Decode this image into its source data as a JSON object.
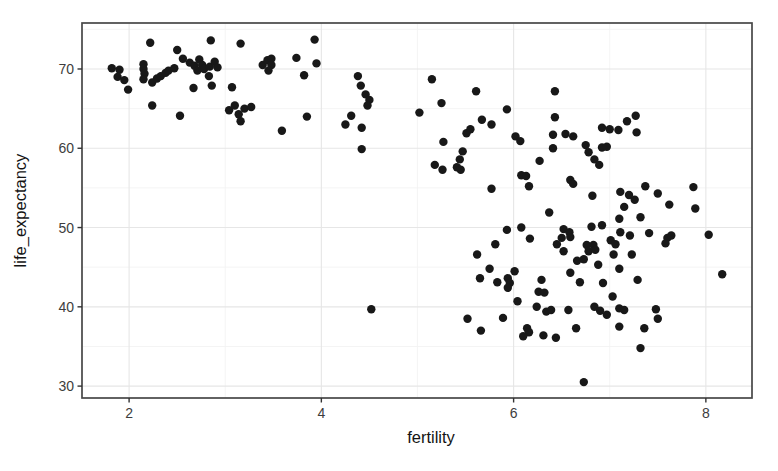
{
  "figure": {
    "background": "#ffffff"
  },
  "chart_data": {
    "type": "scatter",
    "title": "",
    "xlabel": "fertility",
    "ylabel": "life_expectancy",
    "x_ticks": [
      2,
      4,
      6,
      8
    ],
    "y_ticks": [
      30,
      40,
      50,
      60,
      70
    ],
    "x_minor_ticks": [
      3,
      5,
      7
    ],
    "y_minor_ticks": [
      35,
      45,
      55,
      65,
      75
    ],
    "xlim": [
      1.51,
      8.48
    ],
    "ylim": [
      28.5,
      75.8
    ],
    "grid": true,
    "legend": "none",
    "marker": {
      "shape": "circle",
      "color": "#181818",
      "radius_px": 4.2
    },
    "style": {
      "panel_background": "#ffffff",
      "panel_border": "#474747",
      "grid_major": "#e6e6e6",
      "grid_minor": "#f3f3f3",
      "tick_color": "#333333",
      "tick_label_color": "#3d3d3d",
      "axis_title_color": "#141414"
    },
    "points": [
      [
        2.22,
        73.3
      ],
      [
        2.85,
        73.6
      ],
      [
        3.16,
        73.2
      ],
      [
        3.93,
        73.7
      ],
      [
        1.82,
        70.1
      ],
      [
        1.9,
        69.9
      ],
      [
        1.88,
        69.0
      ],
      [
        1.95,
        68.6
      ],
      [
        1.99,
        67.4
      ],
      [
        2.15,
        70.6
      ],
      [
        2.15,
        70.0
      ],
      [
        2.16,
        69.4
      ],
      [
        2.15,
        68.7
      ],
      [
        2.24,
        68.3
      ],
      [
        2.29,
        68.8
      ],
      [
        2.33,
        69.1
      ],
      [
        2.38,
        69.5
      ],
      [
        2.41,
        69.8
      ],
      [
        2.47,
        70.1
      ],
      [
        2.5,
        72.4
      ],
      [
        2.56,
        71.3
      ],
      [
        2.63,
        70.8
      ],
      [
        2.68,
        70.4
      ],
      [
        2.73,
        71.2
      ],
      [
        2.76,
        70.5
      ],
      [
        2.71,
        69.8
      ],
      [
        2.78,
        70.0
      ],
      [
        2.84,
        70.3
      ],
      [
        2.89,
        70.9
      ],
      [
        2.92,
        70.2
      ],
      [
        2.83,
        69.1
      ],
      [
        2.67,
        67.6
      ],
      [
        2.86,
        67.9
      ],
      [
        3.07,
        67.7
      ],
      [
        2.24,
        65.4
      ],
      [
        2.53,
        64.1
      ],
      [
        3.04,
        64.8
      ],
      [
        3.1,
        65.4
      ],
      [
        3.14,
        64.3
      ],
      [
        3.16,
        63.4
      ],
      [
        3.2,
        65.0
      ],
      [
        3.27,
        65.2
      ],
      [
        3.39,
        70.5
      ],
      [
        3.44,
        71.1
      ],
      [
        3.48,
        71.3
      ],
      [
        3.48,
        70.5
      ],
      [
        3.45,
        69.8
      ],
      [
        3.74,
        71.4
      ],
      [
        3.95,
        70.7
      ],
      [
        3.82,
        69.2
      ],
      [
        3.85,
        64.0
      ],
      [
        3.59,
        62.2
      ],
      [
        4.38,
        69.1
      ],
      [
        4.41,
        67.9
      ],
      [
        4.46,
        66.8
      ],
      [
        4.5,
        66.1
      ],
      [
        4.48,
        65.4
      ],
      [
        4.31,
        64.1
      ],
      [
        4.25,
        63.0
      ],
      [
        4.42,
        62.6
      ],
      [
        4.42,
        59.9
      ],
      [
        5.15,
        68.7
      ],
      [
        5.25,
        65.7
      ],
      [
        5.61,
        67.2
      ],
      [
        5.02,
        64.5
      ],
      [
        5.67,
        63.6
      ],
      [
        5.77,
        63.0
      ],
      [
        5.51,
        61.9
      ],
      [
        5.55,
        62.4
      ],
      [
        5.27,
        60.8
      ],
      [
        5.47,
        59.6
      ],
      [
        5.44,
        58.6
      ],
      [
        5.18,
        57.9
      ],
      [
        5.26,
        57.3
      ],
      [
        5.41,
        57.6
      ],
      [
        5.45,
        57.3
      ],
      [
        5.77,
        54.9
      ],
      [
        5.93,
        64.9
      ],
      [
        6.02,
        61.5
      ],
      [
        6.07,
        60.9
      ],
      [
        6.27,
        58.4
      ],
      [
        6.08,
        56.6
      ],
      [
        6.13,
        56.5
      ],
      [
        6.16,
        55.2
      ],
      [
        6.43,
        67.2
      ],
      [
        6.43,
        63.9
      ],
      [
        6.41,
        61.7
      ],
      [
        6.54,
        61.8
      ],
      [
        6.62,
        61.5
      ],
      [
        6.41,
        60.0
      ],
      [
        6.75,
        60.4
      ],
      [
        6.78,
        59.5
      ],
      [
        6.59,
        56.0
      ],
      [
        6.62,
        55.5
      ],
      [
        6.92,
        60.1
      ],
      [
        6.97,
        60.2
      ],
      [
        6.84,
        58.6
      ],
      [
        6.89,
        57.9
      ],
      [
        6.92,
        62.6
      ],
      [
        7.0,
        62.4
      ],
      [
        7.09,
        62.3
      ],
      [
        7.18,
        63.4
      ],
      [
        7.27,
        64.1
      ],
      [
        7.28,
        62.0
      ],
      [
        7.11,
        54.5
      ],
      [
        7.2,
        54.1
      ],
      [
        7.26,
        53.5
      ],
      [
        7.37,
        55.2
      ],
      [
        7.5,
        54.3
      ],
      [
        7.15,
        52.6
      ],
      [
        6.82,
        54.0
      ],
      [
        7.62,
        52.9
      ],
      [
        7.87,
        55.1
      ],
      [
        7.89,
        52.4
      ],
      [
        6.37,
        51.9
      ],
      [
        5.93,
        49.7
      ],
      [
        6.08,
        50.0
      ],
      [
        6.17,
        48.6
      ],
      [
        5.81,
        47.9
      ],
      [
        5.62,
        46.6
      ],
      [
        6.52,
        49.8
      ],
      [
        6.58,
        49.4
      ],
      [
        6.5,
        48.7
      ],
      [
        6.59,
        48.8
      ],
      [
        6.45,
        47.9
      ],
      [
        6.52,
        47.0
      ],
      [
        5.75,
        44.8
      ],
      [
        5.65,
        43.6
      ],
      [
        5.83,
        43.1
      ],
      [
        5.94,
        43.6
      ],
      [
        5.96,
        43.0
      ],
      [
        5.94,
        42.4
      ],
      [
        6.01,
        44.5
      ],
      [
        6.29,
        43.4
      ],
      [
        6.26,
        41.9
      ],
      [
        6.32,
        41.8
      ],
      [
        6.04,
        40.7
      ],
      [
        6.24,
        40.0
      ],
      [
        6.34,
        39.4
      ],
      [
        6.39,
        39.6
      ],
      [
        6.57,
        39.6
      ],
      [
        5.52,
        38.5
      ],
      [
        5.89,
        38.6
      ],
      [
        5.66,
        37.0
      ],
      [
        6.14,
        37.3
      ],
      [
        6.16,
        36.8
      ],
      [
        6.1,
        36.3
      ],
      [
        6.31,
        36.4
      ],
      [
        6.44,
        36.1
      ],
      [
        6.65,
        37.3
      ],
      [
        6.73,
        30.5
      ],
      [
        4.52,
        39.7
      ],
      [
        7.32,
        51.3
      ],
      [
        7.1,
        51.1
      ],
      [
        6.81,
        50.1
      ],
      [
        6.92,
        50.3
      ],
      [
        7.11,
        49.4
      ],
      [
        7.21,
        49.0
      ],
      [
        7.41,
        49.3
      ],
      [
        7.6,
        48.7
      ],
      [
        7.64,
        49.0
      ],
      [
        7.58,
        48.0
      ],
      [
        8.03,
        49.1
      ],
      [
        6.76,
        47.8
      ],
      [
        6.83,
        47.8
      ],
      [
        6.78,
        47.0
      ],
      [
        6.85,
        47.2
      ],
      [
        7.01,
        48.4
      ],
      [
        7.06,
        47.9
      ],
      [
        7.04,
        46.6
      ],
      [
        7.23,
        46.6
      ],
      [
        6.66,
        45.8
      ],
      [
        6.73,
        46.0
      ],
      [
        6.88,
        45.3
      ],
      [
        6.59,
        44.3
      ],
      [
        7.1,
        44.8
      ],
      [
        6.69,
        43.1
      ],
      [
        6.93,
        43.0
      ],
      [
        7.29,
        43.4
      ],
      [
        7.03,
        41.3
      ],
      [
        6.84,
        40.0
      ],
      [
        6.9,
        39.5
      ],
      [
        6.97,
        39.0
      ],
      [
        7.1,
        39.8
      ],
      [
        7.15,
        39.6
      ],
      [
        7.48,
        39.7
      ],
      [
        7.5,
        38.5
      ],
      [
        7.1,
        37.5
      ],
      [
        7.36,
        37.3
      ],
      [
        7.32,
        34.8
      ],
      [
        8.17,
        44.1
      ]
    ]
  }
}
